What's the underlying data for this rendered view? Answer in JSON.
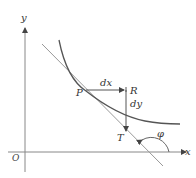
{
  "diagram": {
    "title": "",
    "axes": {
      "x_label": "x",
      "y_label": "y",
      "origin_label": "O"
    },
    "points": {
      "P": "P",
      "R": "R",
      "T": "T"
    },
    "increments": {
      "dx": "dx",
      "dy": "dy"
    },
    "angle_label": "φ",
    "elements": [
      "curve",
      "tangent-line",
      "dx-arrow",
      "dy-arrow",
      "angle-arc"
    ],
    "colors": {
      "curve": "#555555",
      "tangent": "#888888",
      "axes": "#777777",
      "arrows": "#555555"
    }
  }
}
